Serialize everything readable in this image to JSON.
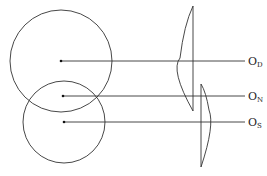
{
  "diagram": {
    "labels": [
      {
        "main": "O",
        "sub": "D"
      },
      {
        "main": "O",
        "sub": "N"
      },
      {
        "main": "O",
        "sub": "S"
      }
    ],
    "colors": {
      "stroke": "#333333",
      "background": "#ffffff"
    }
  }
}
